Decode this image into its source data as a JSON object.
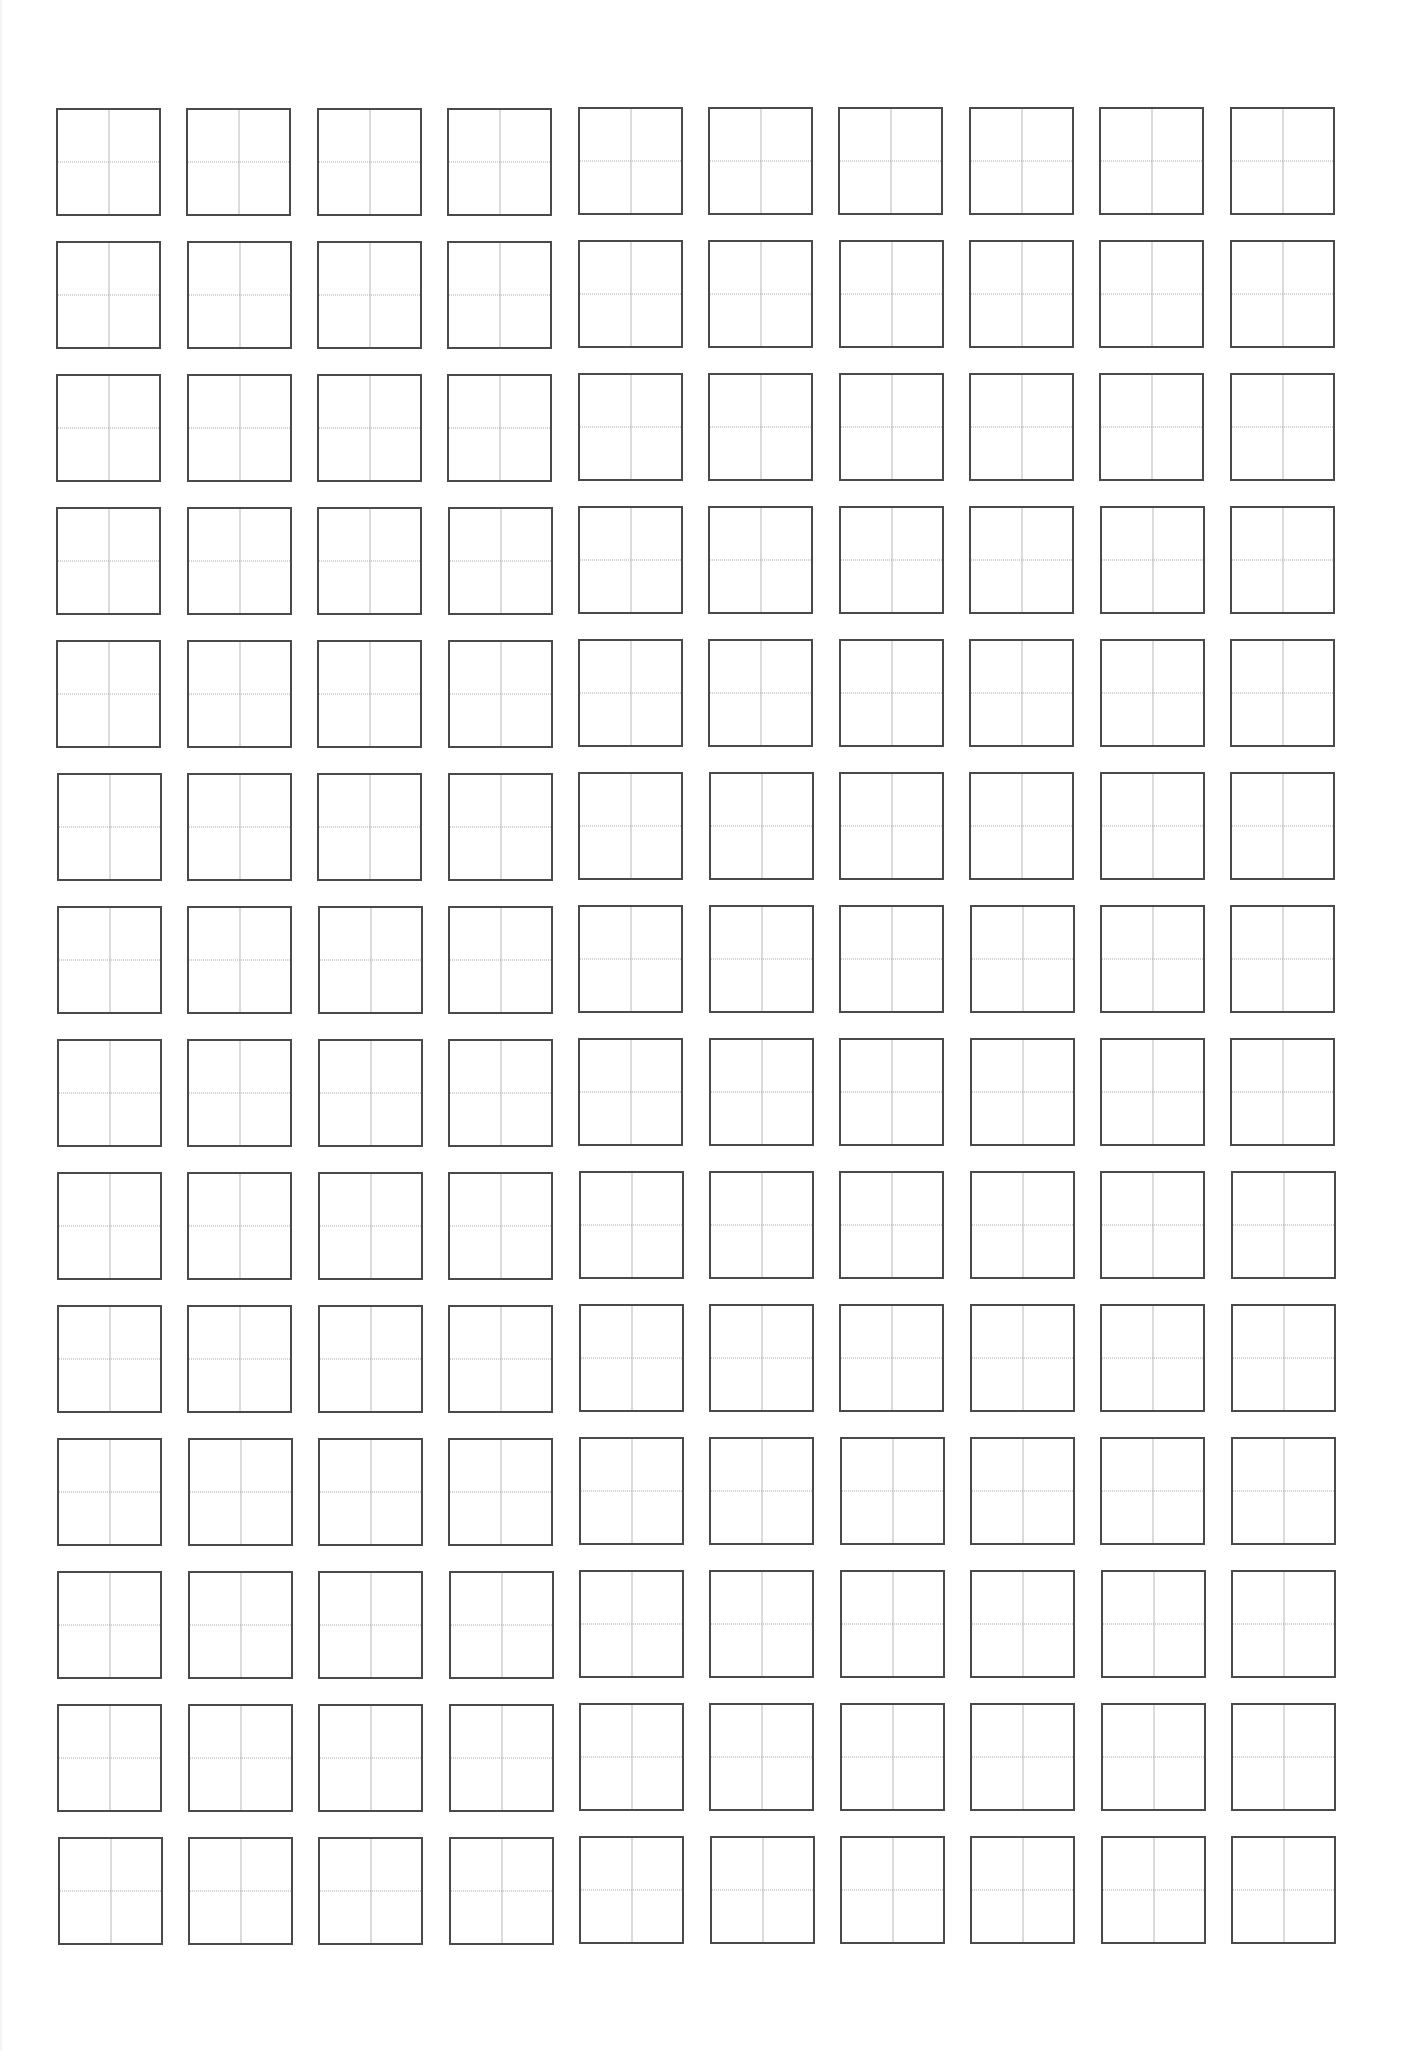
{
  "document": {
    "type": "tian-zi-ge practice sheet",
    "rows": 14,
    "columns": 10,
    "cell": {
      "width_px": 105,
      "height_px": 108,
      "border_color": "#4a4a4a",
      "vertical_guide": "solid",
      "vertical_guide_color": "#b8b8b8",
      "horizontal_guide": "dotted",
      "horizontal_guide_color": "#a8a8a8"
    },
    "layout": {
      "origin_x": 56,
      "origin_y": 108,
      "column_pitch": 130.4,
      "row_pitch": 133.0
    },
    "background": "#ffffff"
  }
}
